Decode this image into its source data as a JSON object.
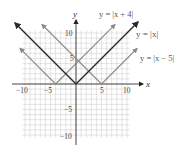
{
  "chart_data": {
    "type": "line",
    "title": "",
    "xlabel": "x",
    "ylabel": "y",
    "xlim": [
      -10.5,
      10.5
    ],
    "ylim": [
      -10.5,
      10.5
    ],
    "grid": true,
    "x_ticks": [
      -10,
      -5,
      5,
      10
    ],
    "y_ticks": [
      10,
      5,
      -5,
      -10
    ],
    "x_tick_labels": [
      "−10",
      "−5",
      "5",
      "10"
    ],
    "y_tick_labels": [
      "10",
      "5",
      "−5",
      "−10"
    ],
    "series": [
      {
        "name": "y = |x + 4|",
        "vertex": [
          -4,
          0
        ],
        "x": [
          -11,
          -4,
          3.5
        ],
        "y": [
          7,
          0,
          7.5
        ],
        "color": "#8a8a8a",
        "label_position": "top-right"
      },
      {
        "name": "y = |x|",
        "vertex": [
          0,
          0
        ],
        "x": [
          -11,
          0,
          11.5
        ],
        "y": [
          11,
          0,
          11.5
        ],
        "color": "#2a2a2a",
        "label_position": "right"
      },
      {
        "name": "y = |x − 5|",
        "vertex": [
          5,
          0
        ],
        "x": [
          -5,
          5,
          11
        ],
        "y": [
          10,
          0,
          6
        ],
        "color": "#8a8a8a",
        "label_position": "right-lower"
      }
    ],
    "legend": "inline labels"
  },
  "labels": {
    "x_axis": "x",
    "y_axis": "y",
    "curve_1": "y = |x + 4|",
    "curve_2": "y = |x|",
    "curve_3": "y = |x − 5|"
  },
  "ticks": {
    "x_neg10": "−10",
    "x_neg5": "−5",
    "x_5": "5",
    "x_10": "10",
    "y_10": "10",
    "y_5": "5",
    "y_neg5": "−5",
    "y_neg10": "−10"
  },
  "colors": {
    "grid": "#c8c8c8",
    "axis": "#333333",
    "dark_curve": "#2a2a2a",
    "light_curve": "#8a8a8a",
    "label": "#666666"
  }
}
